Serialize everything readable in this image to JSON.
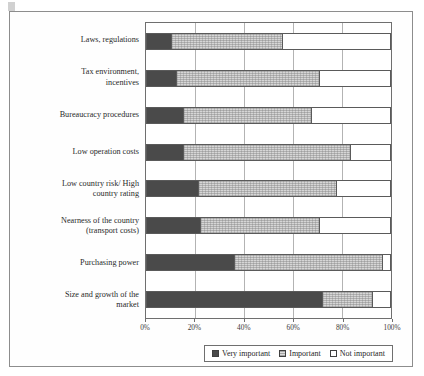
{
  "chart_data": {
    "type": "bar",
    "orientation": "horizontal",
    "stacked": true,
    "stack_mode": "percent",
    "title": "",
    "subtitle": "",
    "xlabel": "",
    "ylabel": "",
    "xlim": [
      0,
      100
    ],
    "xticks": [
      "0%",
      "20%",
      "40%",
      "60%",
      "80%",
      "100%"
    ],
    "xtick_values": [
      0,
      20,
      40,
      60,
      80,
      100
    ],
    "grid": true,
    "grid_axis": "x",
    "legend_position": "bottom-right",
    "categories": [
      "Laws, regulations",
      "Tax environment, incentives",
      "Bureaucracy procedures",
      "Low operation costs",
      "Low country risk/ High country rating",
      "Nearness of the country (transport  costs)",
      "Purchasing power",
      "Size and growth of the market"
    ],
    "category_lines": [
      [
        "Laws, regulations"
      ],
      [
        "Tax environment,",
        "incentives"
      ],
      [
        "Bureaucracy procedures"
      ],
      [
        "Low operation costs"
      ],
      [
        "Low country risk/ High",
        "country rating"
      ],
      [
        "Nearness of the country",
        "(transport  costs)"
      ],
      [
        "Purchasing power"
      ],
      [
        "Size and growth of the",
        "market"
      ]
    ],
    "series": [
      {
        "name": "Very important",
        "color": "#4a4a4a",
        "values": [
          10,
          12,
          15,
          15,
          21,
          22,
          36,
          72
        ]
      },
      {
        "name": "Important",
        "color": "#d6d6d6",
        "values": [
          46,
          59,
          53,
          69,
          57,
          49,
          61,
          21
        ]
      },
      {
        "name": "Not important",
        "color": "#ffffff",
        "values": [
          44,
          29,
          32,
          16,
          22,
          29,
          3,
          7
        ]
      }
    ]
  },
  "legend": {
    "items": [
      {
        "label": "Very important",
        "swatch": "very"
      },
      {
        "label": "Important",
        "swatch": "imp"
      },
      {
        "label": "Not important",
        "swatch": "not"
      }
    ]
  },
  "colors": {
    "very_important": "#4a4a4a",
    "important": "#d6d6d6",
    "not_important": "#ffffff",
    "frame": "#8d8d8d",
    "axis": "#6f6f6f",
    "gridline": "#b3b3b3"
  }
}
